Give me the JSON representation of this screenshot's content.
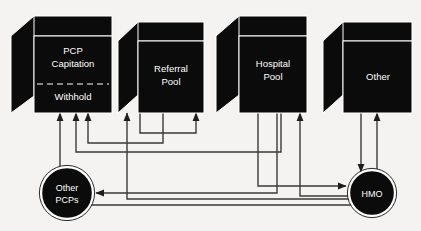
{
  "diagram": {
    "background_color": "#f4f3f1",
    "node_fill": "#0b0b0b",
    "node_stroke": "#ffffff",
    "line_color": "#3a3a3a",
    "nodes": {
      "pcp": {
        "shape": "cube",
        "label_line1": "PCP",
        "label_line2": "Capitation",
        "label_line3": "Withhold",
        "divider": "dashed"
      },
      "referral": {
        "shape": "cube",
        "label_line1": "Referral",
        "label_line2": "Pool"
      },
      "hospital": {
        "shape": "cube",
        "label_line1": "Hospital",
        "label_line2": "Pool"
      },
      "other": {
        "shape": "cube",
        "label_line1": "Other"
      },
      "other_pcps": {
        "shape": "circle",
        "label_line1": "Other",
        "label_line2": "PCPs"
      },
      "hmo": {
        "shape": "circle",
        "label_line1": "HMO"
      }
    }
  }
}
